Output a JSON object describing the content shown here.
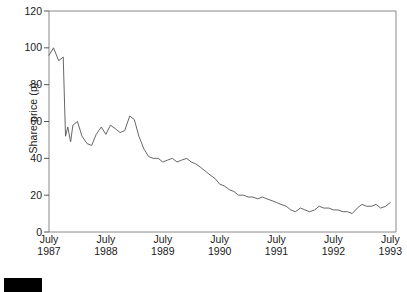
{
  "chart_data": {
    "type": "line",
    "title": "",
    "subtitle": "",
    "xlabel": "",
    "ylabel": "Share price (p)",
    "ylim": [
      0,
      120
    ],
    "y_ticks": [
      0,
      20,
      40,
      60,
      80,
      100,
      120
    ],
    "y_tick_labels": [
      "0",
      "20",
      "40",
      "60",
      "80",
      "100",
      "120"
    ],
    "xlim": [
      1987.5,
      1993.6
    ],
    "x_ticks": [
      1987.5,
      1988.5,
      1989.5,
      1990.5,
      1991.5,
      1992.5,
      1993.5
    ],
    "x_tick_labels": [
      {
        "month": "July",
        "year": "1987"
      },
      {
        "month": "July",
        "year": "1988"
      },
      {
        "month": "July",
        "year": "1989"
      },
      {
        "month": "July",
        "year": "1990"
      },
      {
        "month": "July",
        "year": "1991"
      },
      {
        "month": "July",
        "year": "1992"
      },
      {
        "month": "July",
        "year": "1993"
      }
    ],
    "grid": false,
    "legend": null,
    "legend_position": "none",
    "line_color": "#555555",
    "axis_color": "#888888",
    "series": [
      {
        "name": "Share price",
        "x": [
          1987.5,
          1987.58,
          1987.67,
          1987.75,
          1987.79,
          1987.83,
          1987.88,
          1987.92,
          1988.0,
          1988.08,
          1988.17,
          1988.25,
          1988.33,
          1988.42,
          1988.5,
          1988.58,
          1988.67,
          1988.75,
          1988.83,
          1988.92,
          1989.0,
          1989.08,
          1989.17,
          1989.25,
          1989.33,
          1989.42,
          1989.5,
          1989.58,
          1989.67,
          1989.75,
          1989.83,
          1989.92,
          1990.0,
          1990.08,
          1990.17,
          1990.25,
          1990.33,
          1990.42,
          1990.5,
          1990.58,
          1990.67,
          1990.75,
          1990.83,
          1990.92,
          1991.0,
          1991.08,
          1991.17,
          1991.25,
          1991.33,
          1991.42,
          1991.5,
          1991.58,
          1991.67,
          1991.75,
          1991.83,
          1991.92,
          1992.0,
          1992.08,
          1992.17,
          1992.25,
          1992.33,
          1992.42,
          1992.5,
          1992.58,
          1992.67,
          1992.75,
          1992.83,
          1992.92,
          1993.0,
          1993.08,
          1993.17,
          1993.25,
          1993.33,
          1993.42,
          1993.5
        ],
        "values": [
          96,
          100,
          93,
          95,
          52,
          57,
          49,
          58,
          60,
          52,
          48,
          47,
          53,
          57,
          53,
          58,
          56,
          54,
          55,
          63,
          61,
          52,
          45,
          41,
          40,
          40,
          38,
          39,
          40,
          38,
          39,
          40,
          38,
          37,
          35,
          33,
          31,
          29,
          26,
          25,
          23,
          22,
          20,
          20,
          19,
          19,
          18,
          19,
          18,
          17,
          16,
          15,
          14,
          12,
          11,
          13,
          12,
          11,
          12,
          14,
          13,
          13,
          12,
          12,
          11,
          11,
          10,
          13,
          15,
          14,
          14,
          15,
          13,
          14,
          16
        ]
      }
    ]
  },
  "caption": {
    "chip_label": ""
  }
}
